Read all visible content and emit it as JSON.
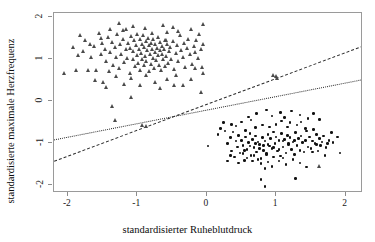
{
  "chart_data": {
    "type": "scatter",
    "title": "",
    "xlabel": "standardisierter Ruheblutdruck",
    "ylabel": "standardisierte maximale Herzfrequenz",
    "xlim": [
      -2.2,
      2.25
    ],
    "ylim": [
      -2.2,
      2.1
    ],
    "xticks": [
      -2,
      -1,
      0,
      1,
      2
    ],
    "xticklabels": [
      "-2",
      "-1",
      "0",
      "1",
      "2"
    ],
    "yticks": [
      -2,
      -1,
      0,
      1,
      2
    ],
    "yticklabels": [
      "-2",
      "-1",
      "0",
      "1",
      "2"
    ],
    "grid": false,
    "legend": "none",
    "series": [
      {
        "name": "Gruppe 1",
        "marker": "triangle",
        "color": "#4a4a4a",
        "points": [
          [
            -2.05,
            0.65
          ],
          [
            -1.82,
            1.56
          ],
          [
            -1.78,
            1.18
          ],
          [
            -1.74,
            1.45
          ],
          [
            -1.7,
            0.74
          ],
          [
            -1.66,
            1.05
          ],
          [
            -1.62,
            1.3
          ],
          [
            -1.58,
            0.72
          ],
          [
            -1.55,
            1.62
          ],
          [
            -1.52,
            1.1
          ],
          [
            -1.5,
            1.38
          ],
          [
            -1.48,
            0.44
          ],
          [
            -1.46,
            1.24
          ],
          [
            -1.44,
            0.95
          ],
          [
            -1.42,
            1.52
          ],
          [
            -1.4,
            0.7
          ],
          [
            -1.38,
            1.16
          ],
          [
            -1.36,
            1.4
          ],
          [
            -1.34,
            0.86
          ],
          [
            -1.32,
            1.28
          ],
          [
            -1.3,
            1.05
          ],
          [
            -1.28,
            1.6
          ],
          [
            -1.26,
            0.78
          ],
          [
            -1.24,
            1.34
          ],
          [
            -1.22,
            1.12
          ],
          [
            -1.2,
            1.46
          ],
          [
            -1.18,
            0.92
          ],
          [
            -1.16,
            1.22
          ],
          [
            -1.15,
            1.7
          ],
          [
            -1.14,
            1.02
          ],
          [
            -1.12,
            1.38
          ],
          [
            -1.1,
            0.66
          ],
          [
            -1.09,
            1.26
          ],
          [
            -1.08,
            1.54
          ],
          [
            -1.06,
            0.98
          ],
          [
            -1.05,
            1.18
          ],
          [
            -1.04,
            1.44
          ],
          [
            -1.02,
            0.82
          ],
          [
            -1.01,
            1.32
          ],
          [
            -1.0,
            1.08
          ],
          [
            -0.99,
            1.6
          ],
          [
            -0.98,
            0.9
          ],
          [
            -0.97,
            1.22
          ],
          [
            -0.96,
            1.48
          ],
          [
            -0.95,
            0.74
          ],
          [
            -0.94,
            1.14
          ],
          [
            -0.93,
            1.36
          ],
          [
            -0.92,
            1.0
          ],
          [
            -0.91,
            1.56
          ],
          [
            -0.9,
            0.84
          ],
          [
            -0.89,
            1.28
          ],
          [
            -0.88,
            1.06
          ],
          [
            -0.87,
            1.42
          ],
          [
            -0.86,
            0.94
          ],
          [
            -0.85,
            1.2
          ],
          [
            -0.84,
            1.5
          ],
          [
            -0.83,
            0.7
          ],
          [
            -0.82,
            1.32
          ],
          [
            -0.81,
            1.1
          ],
          [
            -0.8,
            1.38
          ],
          [
            -0.79,
            0.88
          ],
          [
            -0.78,
            1.24
          ],
          [
            -0.77,
            1.02
          ],
          [
            -0.76,
            1.46
          ],
          [
            -0.75,
            0.78
          ],
          [
            -0.74,
            1.16
          ],
          [
            -0.73,
            1.34
          ],
          [
            -0.72,
            0.96
          ],
          [
            -0.71,
            1.26
          ],
          [
            -0.7,
            1.08
          ],
          [
            -0.69,
            1.52
          ],
          [
            -0.68,
            0.86
          ],
          [
            -0.67,
            1.2
          ],
          [
            -0.66,
            1.4
          ],
          [
            -0.65,
            0.72
          ],
          [
            -0.64,
            1.12
          ],
          [
            -0.63,
            1.3
          ],
          [
            -0.62,
            0.98
          ],
          [
            -0.61,
            1.22
          ],
          [
            -0.6,
            1.44
          ],
          [
            -0.59,
            0.82
          ],
          [
            -0.58,
            1.06
          ],
          [
            -0.57,
            1.36
          ],
          [
            -0.56,
            1.64
          ],
          [
            -0.55,
            0.9
          ],
          [
            -0.54,
            1.18
          ],
          [
            -0.52,
            1.28
          ],
          [
            -0.5,
            1.0
          ],
          [
            -0.48,
            1.42
          ],
          [
            -0.46,
            0.76
          ],
          [
            -0.44,
            1.14
          ],
          [
            -0.42,
            1.32
          ],
          [
            -0.4,
            0.94
          ],
          [
            -0.38,
            1.56
          ],
          [
            -0.36,
            1.2
          ],
          [
            -0.34,
            1.04
          ],
          [
            -0.32,
            1.38
          ],
          [
            -0.3,
            0.8
          ],
          [
            -0.28,
            1.26
          ],
          [
            -0.26,
            1.48
          ],
          [
            -0.24,
            1.1
          ],
          [
            -0.22,
            1.72
          ],
          [
            -0.2,
            0.88
          ],
          [
            -0.18,
            1.3
          ],
          [
            -0.16,
            1.16
          ],
          [
            -0.14,
            1.44
          ],
          [
            -0.12,
            1.02
          ],
          [
            -0.1,
            1.58
          ],
          [
            -0.08,
            1.24
          ],
          [
            -0.06,
            0.8
          ],
          [
            -0.05,
            1.36
          ],
          [
            -0.04,
            1.82
          ],
          [
            -1.25,
            1.86
          ],
          [
            -1.05,
            1.78
          ],
          [
            -0.88,
            1.74
          ],
          [
            -0.62,
            1.8
          ],
          [
            -0.48,
            1.76
          ],
          [
            -1.38,
            1.72
          ],
          [
            -1.52,
            1.5
          ],
          [
            -1.68,
            1.36
          ],
          [
            -1.88,
            0.72
          ],
          [
            -1.6,
            0.5
          ],
          [
            -1.44,
            0.32
          ],
          [
            -1.3,
            0.58
          ],
          [
            -1.18,
            0.4
          ],
          [
            -1.08,
            0.54
          ],
          [
            -0.96,
            0.36
          ],
          [
            -0.86,
            0.6
          ],
          [
            -0.74,
            0.44
          ],
          [
            -0.66,
            0.3
          ],
          [
            -0.56,
            0.52
          ],
          [
            -0.46,
            0.38
          ],
          [
            -1.36,
            -0.14
          ],
          [
            -1.32,
            -0.46
          ],
          [
            -1.08,
            0.08
          ],
          [
            -0.92,
            -0.58
          ],
          [
            -0.86,
            -0.6
          ],
          [
            -0.34,
            0.36
          ],
          [
            -0.44,
            0.62
          ],
          [
            -0.22,
            0.52
          ],
          [
            1.0,
            0.58
          ],
          [
            1.02,
            0.54
          ],
          [
            0.96,
            0.62
          ],
          [
            -0.05,
            0.66
          ],
          [
            -0.08,
            0.2
          ],
          [
            -1.92,
            1.28
          ],
          [
            -1.84,
            1.08
          ],
          [
            -1.2,
            1.68
          ],
          [
            -0.78,
            1.62
          ],
          [
            -0.58,
            1.44
          ],
          [
            -0.4,
            1.66
          ],
          [
            -0.16,
            0.78
          ],
          [
            1.62,
            -1.56
          ]
        ]
      },
      {
        "name": "Gruppe 2",
        "marker": "circle",
        "color": "#111111",
        "points": [
          [
            0.02,
            -1.08
          ],
          [
            0.16,
            -0.8
          ],
          [
            0.2,
            -0.66
          ],
          [
            0.26,
            -0.72
          ],
          [
            0.3,
            -1.02
          ],
          [
            0.34,
            -0.88
          ],
          [
            0.36,
            -1.2
          ],
          [
            0.38,
            -0.74
          ],
          [
            0.4,
            -1.34
          ],
          [
            0.42,
            -0.96
          ],
          [
            0.44,
            -1.1
          ],
          [
            0.46,
            -0.82
          ],
          [
            0.48,
            -1.24
          ],
          [
            0.5,
            -0.94
          ],
          [
            0.52,
            -1.06
          ],
          [
            0.54,
            -1.42
          ],
          [
            0.56,
            -0.86
          ],
          [
            0.58,
            -1.16
          ],
          [
            0.6,
            -1.0
          ],
          [
            0.62,
            -0.78
          ],
          [
            0.64,
            -1.3
          ],
          [
            0.66,
            -0.92
          ],
          [
            0.68,
            -1.12
          ],
          [
            0.7,
            -0.84
          ],
          [
            0.72,
            -1.22
          ],
          [
            0.74,
            -0.98
          ],
          [
            0.76,
            -1.04
          ],
          [
            0.78,
            -1.38
          ],
          [
            0.8,
            -0.88
          ],
          [
            0.82,
            -1.18
          ],
          [
            0.84,
            -0.96
          ],
          [
            0.86,
            -1.26
          ],
          [
            0.88,
            -0.8
          ],
          [
            0.9,
            -1.08
          ],
          [
            0.92,
            -0.9
          ],
          [
            0.94,
            -1.14
          ],
          [
            0.96,
            -0.74
          ],
          [
            0.98,
            -1.02
          ],
          [
            1.0,
            -0.86
          ],
          [
            1.02,
            -1.2
          ],
          [
            1.04,
            -0.94
          ],
          [
            1.06,
            -1.32
          ],
          [
            1.08,
            -0.78
          ],
          [
            1.1,
            -1.1
          ],
          [
            1.12,
            -0.92
          ],
          [
            1.14,
            -1.24
          ],
          [
            1.16,
            -0.82
          ],
          [
            1.18,
            -1.04
          ],
          [
            1.2,
            -0.88
          ],
          [
            1.22,
            -1.16
          ],
          [
            1.24,
            -0.98
          ],
          [
            1.26,
            -1.28
          ],
          [
            1.28,
            -0.76
          ],
          [
            1.3,
            -1.06
          ],
          [
            1.32,
            -0.9
          ],
          [
            1.34,
            -1.18
          ],
          [
            1.36,
            -0.84
          ],
          [
            1.38,
            -1.0
          ],
          [
            1.4,
            -1.22
          ],
          [
            1.42,
            -0.94
          ],
          [
            1.44,
            -0.72
          ],
          [
            1.46,
            -1.1
          ],
          [
            1.48,
            -0.86
          ],
          [
            1.5,
            -1.14
          ],
          [
            1.52,
            -0.96
          ],
          [
            1.54,
            -0.68
          ],
          [
            1.56,
            -1.02
          ],
          [
            1.58,
            -0.8
          ],
          [
            1.6,
            -1.2
          ],
          [
            1.62,
            -0.9
          ],
          [
            1.64,
            -1.06
          ],
          [
            1.68,
            -0.84
          ],
          [
            1.72,
            -1.12
          ],
          [
            1.76,
            -0.94
          ],
          [
            1.8,
            -0.76
          ],
          [
            1.88,
            -0.86
          ],
          [
            1.92,
            -1.24
          ],
          [
            0.72,
            -0.3
          ],
          [
            0.86,
            -0.22
          ],
          [
            0.94,
            -0.36
          ],
          [
            1.06,
            -0.28
          ],
          [
            1.12,
            -0.4
          ],
          [
            1.22,
            -0.24
          ],
          [
            1.34,
            -0.34
          ],
          [
            1.46,
            -0.42
          ],
          [
            1.54,
            -0.3
          ],
          [
            1.62,
            -0.44
          ],
          [
            0.6,
            -0.38
          ],
          [
            0.5,
            -0.5
          ],
          [
            0.42,
            -0.6
          ],
          [
            0.36,
            -0.56
          ],
          [
            0.24,
            -0.52
          ],
          [
            0.78,
            -1.5
          ],
          [
            0.84,
            -1.62
          ],
          [
            0.88,
            -1.46
          ],
          [
            0.94,
            -1.56
          ],
          [
            0.78,
            -1.88
          ],
          [
            0.84,
            -2.04
          ],
          [
            1.28,
            -1.86
          ],
          [
            1.04,
            -1.44
          ],
          [
            1.14,
            -1.52
          ],
          [
            1.24,
            -1.4
          ],
          [
            1.34,
            -1.48
          ],
          [
            1.44,
            -1.58
          ],
          [
            0.66,
            -1.44
          ],
          [
            0.58,
            -1.36
          ],
          [
            0.46,
            -1.48
          ],
          [
            0.52,
            -1.26
          ],
          [
            0.68,
            -1.3
          ],
          [
            0.74,
            -1.4
          ],
          [
            0.96,
            -1.34
          ],
          [
            1.1,
            -1.36
          ],
          [
            1.52,
            -1.22
          ],
          [
            1.7,
            -1.3
          ],
          [
            0.3,
            -1.44
          ],
          [
            0.34,
            -1.3
          ],
          [
            0.9,
            -0.62
          ],
          [
            0.8,
            -0.58
          ],
          [
            0.7,
            -0.64
          ],
          [
            1.0,
            -0.56
          ],
          [
            1.16,
            -0.62
          ],
          [
            1.3,
            -0.58
          ],
          [
            1.42,
            -0.66
          ],
          [
            0.56,
            -0.7
          ],
          [
            0.64,
            -0.46
          ],
          [
            1.08,
            -0.48
          ],
          [
            1.2,
            -0.52
          ],
          [
            1.36,
            -0.5
          ],
          [
            0.88,
            -1.04
          ],
          [
            0.96,
            -1.12
          ],
          [
            1.04,
            -1.16
          ],
          [
            0.82,
            -1.06
          ],
          [
            0.76,
            -1.14
          ],
          [
            0.7,
            -1.02
          ],
          [
            0.62,
            -1.08
          ],
          [
            0.54,
            -1.18
          ],
          [
            1.26,
            -0.94
          ],
          [
            1.18,
            -1.02
          ],
          [
            1.1,
            -0.96
          ],
          [
            0.86,
            -1.28
          ],
          [
            1.58,
            -1.04
          ],
          [
            1.66,
            -0.98
          ],
          [
            1.74,
            -1.02
          ],
          [
            1.82,
            -1.0
          ]
        ]
      }
    ],
    "lines": [
      {
        "name": "Trennlinie gestrichelt",
        "style": "dashed",
        "color": "#2b2b2b",
        "x0": -2.2,
        "y0": -1.43,
        "x1": 2.25,
        "y1": 1.32
      },
      {
        "name": "Trennlinie gepunktet",
        "style": "dotted",
        "color": "#2b2b2b",
        "x0": -2.2,
        "y0": -0.92,
        "x1": 2.25,
        "y1": 0.52
      }
    ]
  }
}
